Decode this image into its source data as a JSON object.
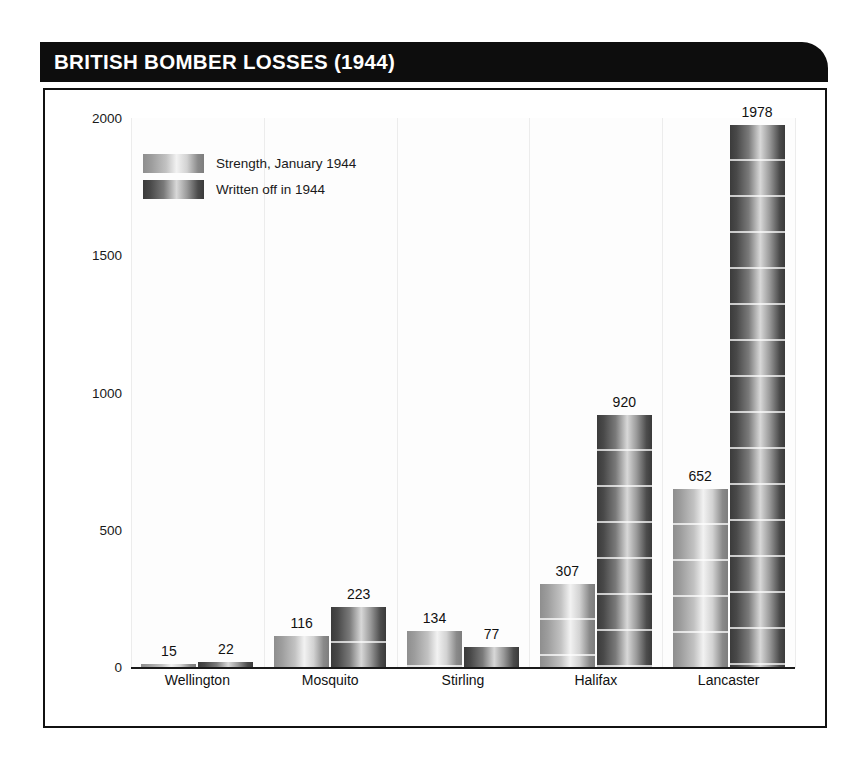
{
  "figure": {
    "title": "BRITISH BOMBER LOSSES (1944)",
    "title_bar_color": "#0d0d0d",
    "title_text_color": "#ffffff",
    "frame_color": "#111111",
    "background_color": "#ffffff"
  },
  "legend": {
    "position": "inside-top-left",
    "entries": [
      {
        "label": "Strength, January 1944",
        "swatch": "light-gray-gradient"
      },
      {
        "label": "Written off in 1944",
        "swatch": "dark-gray-gradient"
      }
    ]
  },
  "chart_data": {
    "type": "bar",
    "title": "BRITISH BOMBER LOSSES (1944)",
    "xlabel": "",
    "ylabel": "",
    "ylim": [
      0,
      2000
    ],
    "yticks": [
      0,
      500,
      1000,
      1500,
      2000
    ],
    "ytick_labels": [
      "0",
      "500",
      "1000",
      "1500",
      "2000"
    ],
    "grid": "vertical-group-separators",
    "legend_position": "inside-top-left",
    "categories": [
      "Wellington",
      "Mosquito",
      "Stirling",
      "Halifax",
      "Lancaster"
    ],
    "series": [
      {
        "name": "Strength, January 1944",
        "color": "#b4b4b4",
        "values": [
          15,
          116,
          134,
          307,
          652
        ]
      },
      {
        "name": "Written off in 1944",
        "color": "#6a6a6a",
        "values": [
          22,
          223,
          77,
          920,
          1978
        ]
      }
    ],
    "data_labels": [
      "15",
      "22",
      "116",
      "223",
      "134",
      "77",
      "307",
      "920",
      "652",
      "1978"
    ]
  }
}
